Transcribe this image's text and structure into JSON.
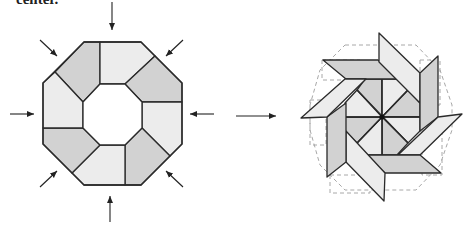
{
  "caption": "center.",
  "colors": {
    "dark": "#d2d2d2",
    "light": "#ececec",
    "mid": "#dedede",
    "stroke": "#2a2a2a",
    "dashed": "#a8a8a8"
  },
  "left_figure": {
    "name": "octagon-ring",
    "outer": [
      [
        84,
        42
      ],
      [
        141,
        42
      ],
      [
        182,
        83
      ],
      [
        182,
        144
      ],
      [
        141,
        185
      ],
      [
        84,
        185
      ],
      [
        43,
        144
      ],
      [
        43,
        83
      ]
    ],
    "inner": [
      [
        100,
        84
      ],
      [
        125,
        84
      ],
      [
        142,
        102
      ],
      [
        142,
        128
      ],
      [
        125,
        145
      ],
      [
        100,
        145
      ],
      [
        83,
        128
      ],
      [
        83,
        102
      ]
    ],
    "pieces": [
      {
        "pts": [
          [
            84,
            42
          ],
          [
            100,
            42
          ],
          [
            100,
            84
          ],
          [
            83,
            102
          ],
          [
            55,
            72
          ]
        ],
        "fill": "dark"
      },
      {
        "pts": [
          [
            100,
            42
          ],
          [
            141,
            42
          ],
          [
            155,
            56
          ],
          [
            125,
            84
          ],
          [
            100,
            84
          ]
        ],
        "fill": "light"
      },
      {
        "pts": [
          [
            155,
            56
          ],
          [
            182,
            83
          ],
          [
            182,
            102
          ],
          [
            142,
            102
          ],
          [
            125,
            84
          ]
        ],
        "fill": "dark"
      },
      {
        "pts": [
          [
            182,
            102
          ],
          [
            182,
            144
          ],
          [
            170,
            156
          ],
          [
            142,
            128
          ],
          [
            142,
            102
          ]
        ],
        "fill": "light"
      },
      {
        "pts": [
          [
            170,
            156
          ],
          [
            141,
            185
          ],
          [
            125,
            185
          ],
          [
            125,
            145
          ],
          [
            142,
            128
          ]
        ],
        "fill": "dark"
      },
      {
        "pts": [
          [
            125,
            185
          ],
          [
            84,
            185
          ],
          [
            72,
            173
          ],
          [
            100,
            145
          ],
          [
            125,
            145
          ]
        ],
        "fill": "light"
      },
      {
        "pts": [
          [
            72,
            173
          ],
          [
            43,
            144
          ],
          [
            43,
            128
          ],
          [
            83,
            128
          ],
          [
            100,
            145
          ]
        ],
        "fill": "dark"
      },
      {
        "pts": [
          [
            43,
            128
          ],
          [
            43,
            83
          ],
          [
            55,
            72
          ],
          [
            83,
            102
          ],
          [
            83,
            128
          ]
        ],
        "fill": "light"
      }
    ],
    "arrows": [
      {
        "from": [
          112,
          2
        ],
        "to": [
          112,
          30
        ]
      },
      {
        "from": [
          40,
          40
        ],
        "to": [
          57,
          56
        ]
      },
      {
        "from": [
          183,
          40
        ],
        "to": [
          166,
          56
        ]
      },
      {
        "from": [
          10,
          114
        ],
        "to": [
          34,
          114
        ]
      },
      {
        "from": [
          214,
          114
        ],
        "to": [
          190,
          114
        ]
      },
      {
        "from": [
          40,
          187
        ],
        "to": [
          57,
          171
        ]
      },
      {
        "from": [
          183,
          187
        ],
        "to": [
          166,
          171
        ]
      },
      {
        "from": [
          110,
          222
        ],
        "to": [
          110,
          196
        ]
      }
    ]
  },
  "transition_arrow": {
    "from": [
      236,
      116
    ],
    "to": [
      276,
      116
    ]
  },
  "right_figure": {
    "name": "pinwheel-star",
    "center": [
      382,
      117
    ],
    "dashed_outline": "M 345 45 L 416 45 L 440 70 L 452 105 L 452 130 L 440 165 L 416 190 L 345 190 L 320 165 L 310 130 L 310 105 L 320 70 Z",
    "inner_triangles": [
      {
        "pts": [
          [
            382,
            117
          ],
          [
            382,
            79
          ],
          [
            365,
            79
          ],
          [
            357,
            90
          ]
        ],
        "fill": "dark"
      },
      {
        "pts": [
          [
            382,
            117
          ],
          [
            382,
            79
          ],
          [
            397,
            79
          ],
          [
            408,
            90
          ]
        ],
        "fill": "light"
      },
      {
        "pts": [
          [
            382,
            117
          ],
          [
            408,
            90
          ],
          [
            420,
            103
          ],
          [
            420,
            117
          ]
        ],
        "fill": "dark"
      },
      {
        "pts": [
          [
            382,
            117
          ],
          [
            420,
            117
          ],
          [
            420,
            131
          ],
          [
            408,
            143
          ]
        ],
        "fill": "light"
      },
      {
        "pts": [
          [
            382,
            117
          ],
          [
            408,
            143
          ],
          [
            397,
            155
          ],
          [
            382,
            155
          ]
        ],
        "fill": "dark"
      },
      {
        "pts": [
          [
            382,
            117
          ],
          [
            382,
            155
          ],
          [
            365,
            155
          ],
          [
            357,
            143
          ]
        ],
        "fill": "light"
      },
      {
        "pts": [
          [
            382,
            117
          ],
          [
            357,
            143
          ],
          [
            345,
            131
          ],
          [
            345,
            117
          ]
        ],
        "fill": "dark"
      },
      {
        "pts": [
          [
            382,
            117
          ],
          [
            345,
            117
          ],
          [
            345,
            103
          ],
          [
            357,
            90
          ]
        ],
        "fill": "light"
      }
    ],
    "spokes": [
      [
        [
          382,
          79
        ],
        [
          382,
          155
        ]
      ],
      [
        [
          345,
          117
        ],
        [
          420,
          117
        ]
      ],
      [
        [
          357,
          90
        ],
        [
          408,
          143
        ]
      ],
      [
        [
          408,
          90
        ],
        [
          357,
          143
        ]
      ]
    ],
    "parallelograms": [
      {
        "pts": [
          [
            323,
            60
          ],
          [
            378,
            60
          ],
          [
            398,
            79
          ],
          [
            346,
            79
          ]
        ],
        "fill": "dark"
      },
      {
        "pts": [
          [
            379,
            33
          ],
          [
            420,
            73
          ],
          [
            420,
            103
          ],
          [
            379,
            62
          ]
        ],
        "fill": "light"
      },
      {
        "pts": [
          [
            438,
            56
          ],
          [
            438,
            117
          ],
          [
            420,
            131
          ],
          [
            420,
            73
          ]
        ],
        "fill": "dark"
      },
      {
        "pts": [
          [
            462,
            114
          ],
          [
            420,
            155
          ],
          [
            398,
            155
          ],
          [
            438,
            117
          ]
        ],
        "fill": "light"
      },
      {
        "pts": [
          [
            441,
            173
          ],
          [
            385,
            173
          ],
          [
            365,
            155
          ],
          [
            420,
            155
          ]
        ],
        "fill": "dark"
      },
      {
        "pts": [
          [
            384,
            201
          ],
          [
            346,
            162
          ],
          [
            346,
            131
          ],
          [
            385,
            173
          ]
        ],
        "fill": "light"
      },
      {
        "pts": [
          [
            327,
            177
          ],
          [
            327,
            117
          ],
          [
            346,
            103
          ],
          [
            346,
            162
          ]
        ],
        "fill": "dark"
      },
      {
        "pts": [
          [
            301,
            118
          ],
          [
            345,
            79
          ],
          [
            366,
            79
          ],
          [
            327,
            117
          ]
        ],
        "fill": "light"
      }
    ],
    "center_dot_radius": 2.5
  }
}
